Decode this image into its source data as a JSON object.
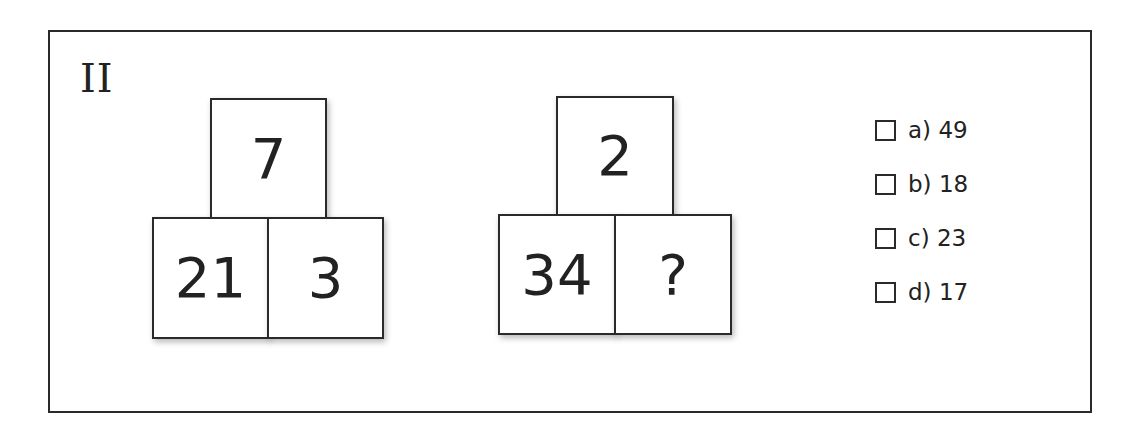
{
  "question": {
    "number_label": "II",
    "puzzles": [
      {
        "top": "7",
        "bottom_left": "21",
        "bottom_right": "3"
      },
      {
        "top": "2",
        "bottom_left": "34",
        "bottom_right": "?"
      }
    ],
    "options": [
      {
        "label": "a) 49"
      },
      {
        "label": "b) 18"
      },
      {
        "label": "c) 23"
      },
      {
        "label": "d) 17"
      }
    ]
  },
  "colors": {
    "border": "#2a2a2a",
    "text": "#222222",
    "background": "#ffffff"
  }
}
